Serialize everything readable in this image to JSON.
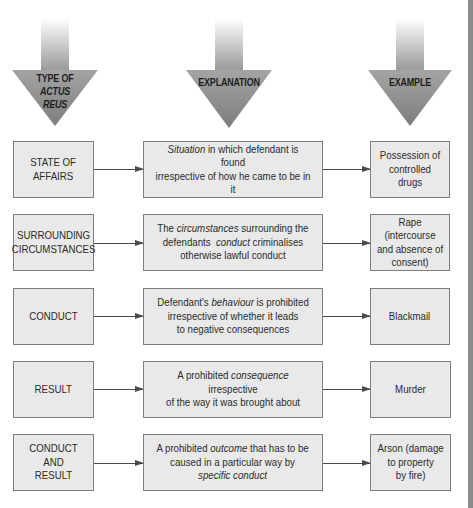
{
  "headers": [
    {
      "id": "type",
      "lines": [
        "TYPE OF",
        "ACTUS",
        "REUS"
      ],
      "italic_lines": [
        1,
        2
      ]
    },
    {
      "id": "explanation",
      "lines": [
        "EXPLANATION"
      ],
      "italic_lines": []
    },
    {
      "id": "example",
      "lines": [
        "EXAMPLE"
      ],
      "italic_lines": []
    }
  ],
  "header_text": {
    "type_line1": "TYPE OF",
    "type_line2": "ACTUS",
    "type_line3": "REUS",
    "explanation": "EXPLANATION",
    "example": "EXAMPLE"
  },
  "rows": [
    {
      "type": [
        "STATE OF",
        "AFFAIRS"
      ],
      "explanation_html": "<em>Situation</em> in which defendant is found<br>irrespective of how he came to be in it",
      "explanation_text": "Situation in which defendant is found irrespective of how he came to be in it",
      "emphasis": [
        "Situation"
      ],
      "example": [
        "Possession of",
        "controlled drugs"
      ]
    },
    {
      "type": [
        "SURROUNDING",
        "CIRCUMSTANCES"
      ],
      "explanation_html": "The <em>circumstances</em> surrounding the<br>defendants&nbsp; <em>conduct</em> criminalises<br>otherwise lawful conduct",
      "explanation_text": "The circumstances surrounding the defendants conduct criminalises otherwise lawful conduct",
      "emphasis": [
        "circumstances",
        "conduct"
      ],
      "example": [
        "Rape (intercourse",
        "and absence of",
        "consent)"
      ]
    },
    {
      "type": [
        "CONDUCT"
      ],
      "explanation_html": "Defendant's <em>behaviour</em> is prohibited<br>irrespective of whether it leads<br>to negative consequences",
      "explanation_text": "Defendant's behaviour is prohibited irrespective of whether it leads to negative consequences",
      "emphasis": [
        "behaviour"
      ],
      "example": [
        "Blackmail"
      ]
    },
    {
      "type": [
        "RESULT"
      ],
      "explanation_html": "A prohibited <em>consequence</em> irrespective<br>of the way it was brought about",
      "explanation_text": "A prohibited consequence irrespective of the way it was brought about",
      "emphasis": [
        "consequence"
      ],
      "example": [
        "Murder"
      ]
    },
    {
      "type": [
        "CONDUCT AND",
        "RESULT"
      ],
      "explanation_html": "A prohibited <em>outcome</em> that has to be<br>caused in a particular way by<br><em>specific conduct</em>",
      "explanation_text": "A prohibited outcome that has to be caused in a particular way by specific conduct",
      "emphasis": [
        "outcome",
        "specific conduct"
      ],
      "example": [
        "Arson (damage",
        "to property",
        "by fire)"
      ]
    }
  ],
  "colors": {
    "box_fill": "#e9e9e9",
    "box_border": "#7d7d7d",
    "arrow_gray": "#8f8f8f",
    "connector": "#4a4a4a",
    "side_bar": "#8a8a8a"
  }
}
